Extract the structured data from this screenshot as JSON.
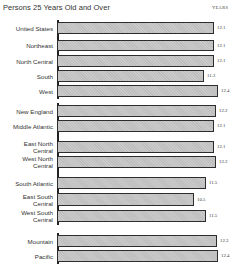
{
  "header": {
    "title_fragment": "Median School Years Completed by Region",
    "subtitle": "Persons 25 Years Old and Over",
    "units_label": "YEARS"
  },
  "chart_data": {
    "type": "bar",
    "orientation": "horizontal",
    "title": "Persons 25 Years Old and Over",
    "xlabel": "",
    "ylabel": "",
    "units": "YEARS",
    "grid": false,
    "legend": null,
    "categories": [
      "United States",
      "Northeast",
      "North Central",
      "South",
      "West",
      "New England",
      "Middle Atlantic",
      "East North Central",
      "West North Central",
      "South Atlantic",
      "East South Central",
      "West South Central",
      "Mountain",
      "Pacific"
    ],
    "values": [
      12.1,
      12.1,
      12.1,
      11.3,
      12.4,
      12.2,
      12.1,
      12.1,
      12.2,
      11.5,
      10.5,
      11.5,
      12.3,
      12.4
    ],
    "groups": [
      {
        "name": "Nation",
        "members": [
          "United States"
        ]
      },
      {
        "name": "Regions",
        "members": [
          "Northeast",
          "North Central",
          "South",
          "West"
        ]
      },
      {
        "name": "Divisions",
        "members": [
          "New England",
          "Middle Atlantic",
          "East North Central",
          "West North Central",
          "South Atlantic",
          "East South Central",
          "West South Central",
          "Mountain",
          "Pacific"
        ]
      }
    ]
  },
  "rows": [
    {
      "label": "United States",
      "value": "12.1",
      "top": 22,
      "h": 12,
      "width": 157
    },
    {
      "label": "Northeast",
      "value": "12.1",
      "top": 40,
      "h": 11,
      "width": 157
    },
    {
      "label": "North Central",
      "value": "12.1",
      "top": 55,
      "h": 12,
      "width": 157
    },
    {
      "label": "South",
      "value": "11.3",
      "top": 70,
      "h": 12,
      "width": 147
    },
    {
      "label": "West",
      "value": "12.4",
      "top": 85,
      "h": 12,
      "width": 161
    },
    {
      "label": "New England",
      "value": "12.2",
      "top": 105,
      "h": 12,
      "width": 159
    },
    {
      "label": "Middle Atlantic",
      "value": "12.1",
      "top": 120,
      "h": 12,
      "width": 157
    },
    {
      "label": "East North\nCentral",
      "value": "12.1",
      "top": 141,
      "h": 12,
      "width": 157
    },
    {
      "label": "West North\nCentral",
      "value": "12.2",
      "top": 156,
      "h": 12,
      "width": 159
    },
    {
      "label": "South Atlantic",
      "value": "11.5",
      "top": 177,
      "h": 12,
      "width": 149
    },
    {
      "label": "East South\nCentral",
      "value": "10.5",
      "top": 193,
      "h": 13,
      "width": 137
    },
    {
      "label": "West South\nCentral",
      "value": "11.5",
      "top": 210,
      "h": 12,
      "width": 149
    },
    {
      "label": "Mountain",
      "value": "12.3",
      "top": 235,
      "h": 12,
      "width": 160
    },
    {
      "label": "Pacific",
      "value": "12.4",
      "top": 250,
      "h": 12,
      "width": 161
    }
  ],
  "axis_segments": [
    {
      "top": 20,
      "h": 79
    },
    {
      "top": 103,
      "h": 122
    },
    {
      "top": 233,
      "h": 31
    }
  ]
}
